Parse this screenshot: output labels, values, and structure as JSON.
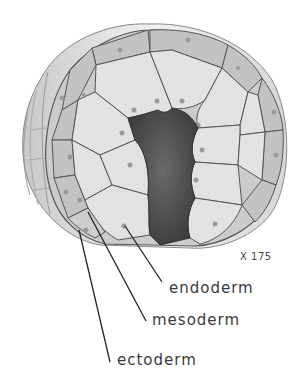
{
  "figure": {
    "magnification": "X 175",
    "labels": [
      {
        "id": "endoderm",
        "text": "endoderm"
      },
      {
        "id": "mesoderm",
        "text": "mesoderm"
      },
      {
        "id": "ectoderm",
        "text": "ectoderm"
      }
    ],
    "colors": {
      "cell_light": "#e4e4e4",
      "cell_mid": "#cfcfcf",
      "cell_dark": "#b5b5b5",
      "cavity": "#4a4a4a",
      "outline": "#555555",
      "label_text": "#3a3a3a",
      "leader_line": "#222222"
    }
  }
}
